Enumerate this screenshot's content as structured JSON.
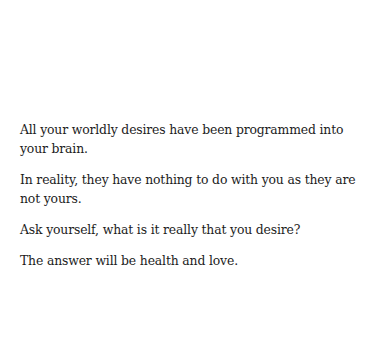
{
  "document": {
    "paragraphs": [
      "All your worldly desires have been programmed into your brain.",
      "In reality, they have nothing to do with you as they are not yours.",
      "Ask yourself, what is it really that you desire?",
      "The answer will be health and love."
    ]
  },
  "colors": {
    "background": "#ffffff",
    "text": "#1c1c1c"
  }
}
